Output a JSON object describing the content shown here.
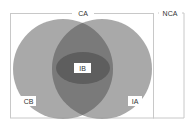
{
  "diagram": {
    "type": "venn",
    "regions": {
      "outer": {
        "label": "NCA"
      },
      "inner_box": {
        "label": "CA"
      },
      "left_circle": {
        "label": "CB"
      },
      "right_circle": {
        "label": "IA"
      },
      "center_ellipse": {
        "label": "IB"
      }
    },
    "colors": {
      "background": "#ffffff",
      "box_stroke": "#c8c8c8",
      "circle_fill": "#8a8a8a",
      "overlap_fill": "#6e6e6e",
      "ellipse_fill": "#5a5a5a",
      "label_bg": "#ffffff",
      "label_text": "#333333"
    }
  }
}
